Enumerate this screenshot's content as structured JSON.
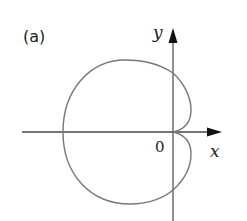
{
  "figure": {
    "panel_label": "(a)",
    "x_axis_label": "x",
    "y_axis_label": "y",
    "origin_label": "0",
    "colors": {
      "curve": "#777777",
      "axes": "#555555",
      "text": "#222222"
    }
  },
  "curve": {
    "description": "Closed polar curve with a cusp-like dimple at the origin, extending mostly to the left",
    "leftmost_x_px": 63,
    "origin_px": [
      173,
      132
    ],
    "top_y_px": 60,
    "bottom_y_px": 204,
    "right_bump_x_px": 191
  }
}
